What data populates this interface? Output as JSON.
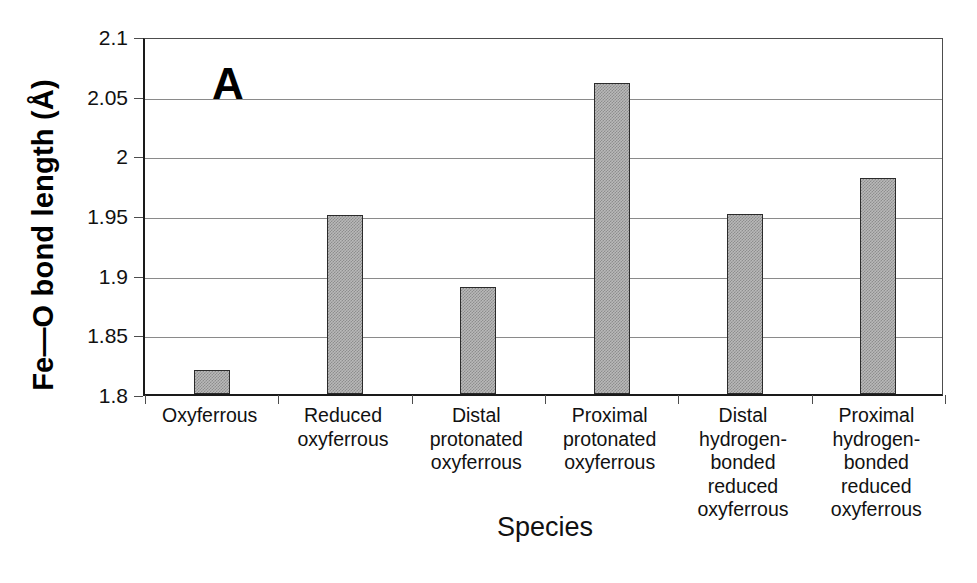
{
  "chart_data": {
    "type": "bar",
    "title": "",
    "panel_label": "A",
    "xlabel": "Species",
    "ylabel": "Fe—O bond length (Å)",
    "categories": [
      "Oxyferrous",
      "Reduced oxyferrous",
      "Distal protonated oxyferrous",
      "Proximal protonated oxyferrous",
      "Distal hydrogen-bonded reduced oxyferrous",
      "Proximal hydrogen-bonded reduced oxyferrous"
    ],
    "category_lines": [
      [
        "Oxyferrous"
      ],
      [
        "Reduced",
        "oxyferrous"
      ],
      [
        "Distal",
        "protonated",
        "oxyferrous"
      ],
      [
        "Proximal",
        "protonated",
        "oxyferrous"
      ],
      [
        "Distal",
        "hydrogen-",
        "bonded",
        "reduced",
        "oxyferrous"
      ],
      [
        "Proximal",
        "hydrogen-",
        "bonded",
        "reduced",
        "oxyferrous"
      ]
    ],
    "values": [
      1.82,
      1.95,
      1.89,
      2.061,
      1.951,
      1.981
    ],
    "ylim": [
      1.8,
      2.1
    ],
    "ytick_values": [
      2.1,
      2.05,
      2.0,
      1.95,
      1.9,
      1.85,
      1.8
    ],
    "ytick_labels": [
      "2.1",
      "2.05",
      "2",
      "1.95",
      "1.9",
      "1.85",
      "1.8"
    ],
    "grid": true,
    "legend": "none",
    "bar_fill": "#b9b9b9",
    "bar_pattern": "fine-checker-dither",
    "bar_border_color": "#2b2b2b",
    "gridline_color": "#8a8a8a",
    "axis_color": "#1a1a1a",
    "background": "#ffffff"
  },
  "axis": {
    "y_title": "Fe—O bond length (Å)",
    "x_title": "Species"
  },
  "labels": {
    "panel": "A"
  },
  "ticks": {
    "y": [
      {
        "label": "2.1",
        "value": 2.1
      },
      {
        "label": "2.05",
        "value": 2.05
      },
      {
        "label": "2",
        "value": 2.0
      },
      {
        "label": "1.95",
        "value": 1.95
      },
      {
        "label": "1.9",
        "value": 1.9
      },
      {
        "label": "1.85",
        "value": 1.85
      },
      {
        "label": "1.8",
        "value": 1.8
      }
    ]
  }
}
